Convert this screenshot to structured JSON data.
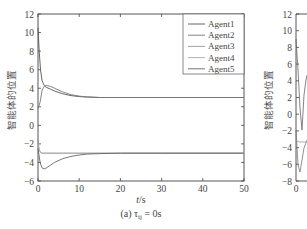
{
  "chart_data": [
    {
      "type": "line",
      "panel": "a",
      "caption": "(a) τ_ij = 0s",
      "caption_main": "(a) τ",
      "caption_sub": "ij",
      "caption_tail": " = 0s",
      "xlabel": "t/s",
      "ylabel": "智能体的位置",
      "xlim": [
        0,
        50
      ],
      "ylim": [
        -6,
        12
      ],
      "xticks": [
        0,
        10,
        20,
        30,
        40,
        50
      ],
      "yticks": [
        -6,
        -4,
        -2,
        0,
        2,
        4,
        6,
        8,
        10,
        12
      ],
      "grid": false,
      "legend_position": "upper right",
      "series": [
        {
          "name": "Agent1",
          "color": "#555555",
          "x": [
            0,
            0.3,
            0.6,
            1,
            1.5,
            2,
            3,
            4,
            6,
            8,
            10,
            12,
            15,
            20,
            30,
            40,
            50
          ],
          "y": [
            10.5,
            8,
            6,
            4.8,
            4.3,
            4.1,
            3.9,
            3.7,
            3.4,
            3.2,
            3.1,
            3.05,
            3.0,
            3.0,
            3.0,
            3.0,
            3.0
          ]
        },
        {
          "name": "Agent2",
          "color": "#777777",
          "x": [
            0,
            0.5,
            1,
            1.5,
            2,
            3,
            4,
            6,
            8,
            10,
            12,
            15,
            20,
            30,
            40,
            50
          ],
          "y": [
            1.8,
            2.5,
            3.8,
            4.2,
            4.3,
            4.2,
            4.0,
            3.6,
            3.3,
            3.15,
            3.05,
            3.0,
            3.0,
            3.0,
            3.0,
            3.0
          ]
        },
        {
          "name": "Agent3",
          "color": "#999999",
          "x": [
            0,
            0.3,
            0.6,
            1,
            2,
            5,
            10,
            20,
            30,
            40,
            50
          ],
          "y": [
            -1.5,
            -2.6,
            -2.9,
            -3.0,
            -3.0,
            -3.0,
            -3.0,
            -3.0,
            -3.0,
            -3.0,
            -3.0
          ]
        },
        {
          "name": "Agent4",
          "color": "#aaaaaa",
          "x": [
            0,
            0.3,
            0.6,
            1,
            2,
            5,
            10,
            20,
            30,
            40,
            50
          ],
          "y": [
            -2.0,
            -2.7,
            -2.95,
            -3.0,
            -3.0,
            -3.0,
            -3.0,
            -3.0,
            -3.0,
            -3.0,
            -3.0
          ]
        },
        {
          "name": "Agent5",
          "color": "#666666",
          "x": [
            0,
            0.5,
            1,
            1.5,
            2,
            3,
            4,
            6,
            8,
            10,
            12,
            15,
            20,
            30,
            40,
            50
          ],
          "y": [
            -2.5,
            -4.0,
            -4.6,
            -4.7,
            -4.6,
            -4.3,
            -4.0,
            -3.6,
            -3.35,
            -3.2,
            -3.1,
            -3.05,
            -3.0,
            -3.0,
            -3.0,
            -3.0
          ]
        }
      ]
    },
    {
      "type": "line",
      "panel": "b (partially visible, cropped)",
      "ylabel": "智能体的位置",
      "ylim": [
        -8,
        12
      ],
      "yticks": [
        -8,
        -6,
        -4,
        -2,
        0,
        2,
        4,
        6,
        8,
        10,
        12
      ],
      "xticks_visible": [
        0
      ]
    }
  ],
  "legend": [
    "Agent1",
    "Agent2",
    "Agent3",
    "Agent4",
    "Agent5"
  ]
}
